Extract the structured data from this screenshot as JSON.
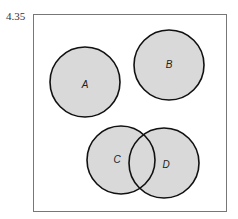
{
  "problem_number": "4.35",
  "diagram": {
    "type": "venn",
    "sets": [
      {
        "label": "A",
        "cx": 85,
        "cy": 82,
        "r": 35
      },
      {
        "label": "B",
        "cx": 169,
        "cy": 65,
        "r": 35
      },
      {
        "label": "C",
        "cx": 121,
        "cy": 160,
        "r": 34
      },
      {
        "label": "D",
        "cx": 164,
        "cy": 163,
        "r": 35
      }
    ],
    "fill": "#d9d9d9",
    "stroke": "#111111"
  }
}
